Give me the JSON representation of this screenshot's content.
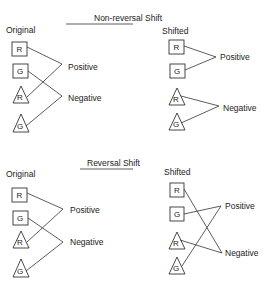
{
  "panels": [
    {
      "id": "non-reversal",
      "title": "Non-reversal Shift",
      "left_label": "Original",
      "right_label": "Shifted",
      "stimuli": [
        "R",
        "G",
        "R",
        "G"
      ],
      "stimulus_shapes": [
        "square",
        "square",
        "triangle",
        "triangle"
      ],
      "outcomes": [
        "Positive",
        "Negative"
      ],
      "original_mapping": {
        "R-square": "Positive",
        "G-square": "Negative",
        "R-triangle": "Positive",
        "G-triangle": "Negative"
      },
      "shifted_mapping": {
        "R-square": "Positive",
        "G-square": "Positive",
        "R-triangle": "Negative",
        "G-triangle": "Negative"
      }
    },
    {
      "id": "reversal",
      "title": "Reversal Shift",
      "left_label": "Original",
      "right_label": "Shifted",
      "stimuli": [
        "R",
        "G",
        "R",
        "G"
      ],
      "stimulus_shapes": [
        "square",
        "square",
        "triangle",
        "triangle"
      ],
      "outcomes": [
        "Positive",
        "Negative"
      ],
      "original_mapping": {
        "R-square": "Positive",
        "G-square": "Negative",
        "R-triangle": "Positive",
        "G-triangle": "Negative"
      },
      "shifted_mapping": {
        "R-square": "Negative",
        "G-square": "Positive",
        "R-triangle": "Negative",
        "G-triangle": "Positive"
      }
    }
  ]
}
